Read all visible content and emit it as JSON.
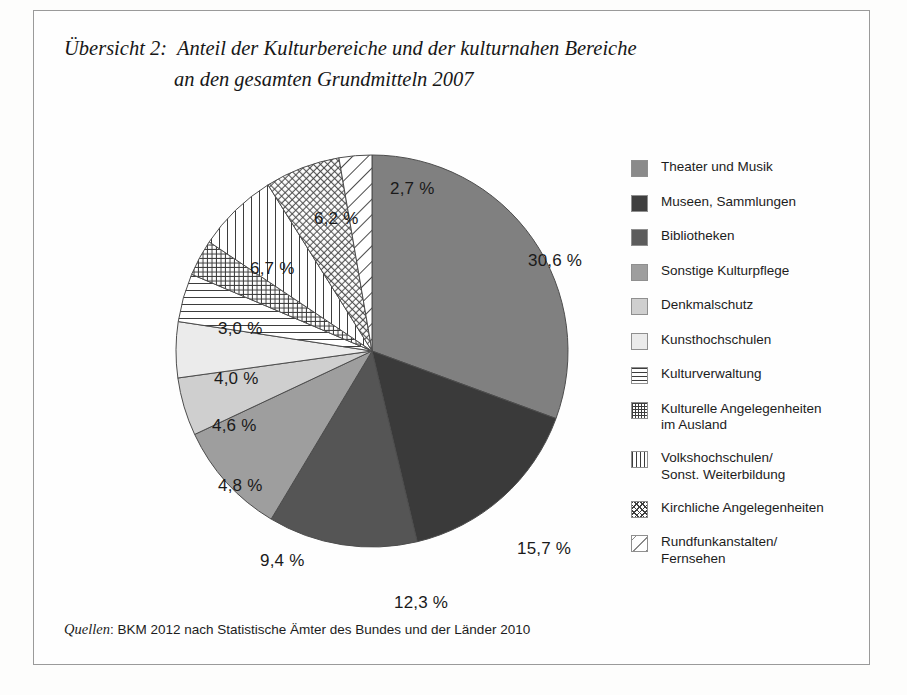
{
  "figure": {
    "title_line1": "Übersicht 2:  Anteil der Kulturbereiche und der kulturnahen Bereiche",
    "title_line2": "an den gesamten Grundmitteln 2007",
    "source_key": "Quellen",
    "source_text": ": BKM 2012 nach Statistische Ämter des Bundes und der Länder 2010",
    "border_color": "#9a9a9a",
    "background": "#fefefe"
  },
  "chart_data": {
    "type": "pie",
    "title": "Übersicht 2:  Anteil der Kulturbereiche und der kulturnahen Bereiche an den gesamten Grundmitteln 2007",
    "unit": "%",
    "total": 100.0,
    "start_angle_deg": 0,
    "direction": "clockwise",
    "legend_position": "right",
    "categories": [
      "Theater und Musik",
      "Museen, Sammlungen",
      "Bibliotheken",
      "Sonstige Kulturpflege",
      "Denkmalschutz",
      "Kunsthochschulen",
      "Kulturverwaltung",
      "Kulturelle Angelegenheiten im Ausland",
      "Volkshochschulen/Sonst. Weiterbildung",
      "Kirchliche Angelegenheiten",
      "Rundfunkanstalten/Fernsehen"
    ],
    "values": [
      30.6,
      15.7,
      12.3,
      9.4,
      4.8,
      4.6,
      4.0,
      3.0,
      6.7,
      6.2,
      2.7
    ],
    "value_labels": [
      "30,6 %",
      "15,7 %",
      "12,3 %",
      "9,4 %",
      "4,8 %",
      "4,6 %",
      "4,0 %",
      "3,0 %",
      "6,7 %",
      "6,2 %",
      "2,7 %"
    ]
  },
  "slices": [
    {
      "label": "Theater und Musik",
      "value_label": "30,6 %",
      "value": 30.6,
      "fill": "#808080",
      "pattern": "solid",
      "label_x": 356,
      "label_y": 100
    },
    {
      "label": "Museen, Sammlungen",
      "value_label": "15,7 %",
      "value": 15.7,
      "fill": "#3a3a3a",
      "pattern": "solid",
      "label_x": 345,
      "label_y": 388
    },
    {
      "label": "Bibliotheken",
      "value_label": "12,3 %",
      "value": 12.3,
      "fill": "#555555",
      "pattern": "solid",
      "label_x": 222,
      "label_y": 442
    },
    {
      "label": "Sonstige Kulturpflege",
      "value_label": "9,4 %",
      "value": 9.4,
      "fill": "#9e9e9e",
      "pattern": "solid",
      "label_x": 88,
      "label_y": 400
    },
    {
      "label": "Denkmalschutz",
      "value_label": "4,8 %",
      "value": 4.8,
      "fill": "#cfcfcf",
      "pattern": "solid",
      "label_x": 46,
      "label_y": 325
    },
    {
      "label": "Kunsthochschulen",
      "value_label": "4,6 %",
      "value": 4.6,
      "fill": "#ebebeb",
      "pattern": "solid",
      "label_x": 40,
      "label_y": 265
    },
    {
      "label": "Kulturverwaltung",
      "value_label": "4,0 %",
      "value": 4.0,
      "fill": "#ffffff",
      "pattern": "horizontal-lines",
      "label_x": 42,
      "label_y": 218
    },
    {
      "label": "Kulturelle Angelegenheiten im Ausland",
      "value_label": "3,0 %",
      "value": 3.0,
      "fill": "#ffffff",
      "pattern": "grid",
      "label_x": 46,
      "label_y": 168
    },
    {
      "label": "Volkshochschulen/Sonst. Weiterbildung",
      "value_label": "6,7 %",
      "value": 6.7,
      "fill": "#ffffff",
      "pattern": "vertical-lines",
      "label_x": 78,
      "label_y": 108
    },
    {
      "label": "Kirchliche Angelegenheiten",
      "value_label": "6,2 %",
      "value": 6.2,
      "fill": "#ffffff",
      "pattern": "diagonal-crosshatch",
      "label_x": 142,
      "label_y": 58
    },
    {
      "label": "Rundfunkanstalten/Fernsehen",
      "value_label": "2,7 %",
      "value": 2.7,
      "fill": "#ffffff",
      "pattern": "diagonal-lines",
      "label_x": 218,
      "label_y": 28
    }
  ],
  "legend": {
    "items": [
      {
        "label": "Theater und Musik",
        "pattern": "solid",
        "fill": "#8a8a8a"
      },
      {
        "label": "Museen, Sammlungen",
        "pattern": "solid",
        "fill": "#3f3f3f"
      },
      {
        "label": "Bibliotheken",
        "pattern": "solid",
        "fill": "#5c5c5c"
      },
      {
        "label": "Sonstige Kulturpflege",
        "pattern": "solid",
        "fill": "#9e9e9e"
      },
      {
        "label": "Denkmalschutz",
        "pattern": "solid",
        "fill": "#cfcfcf"
      },
      {
        "label": "Kunsthochschulen",
        "pattern": "solid",
        "fill": "#ebebeb"
      },
      {
        "label": "Kulturverwaltung",
        "pattern": "horizontal-lines",
        "fill": "#ffffff"
      },
      {
        "label": "Kulturelle Angelegenheiten\nim Ausland",
        "pattern": "grid",
        "fill": "#ffffff"
      },
      {
        "label": "Volkshochschulen/\nSonst. Weiterbildung",
        "pattern": "vertical-lines",
        "fill": "#ffffff"
      },
      {
        "label": "Kirchliche Angelegenheiten",
        "pattern": "diagonal-crosshatch",
        "fill": "#ffffff"
      },
      {
        "label": "Rundfunkanstalten/\nFernsehen",
        "pattern": "diagonal-lines",
        "fill": "#ffffff"
      }
    ]
  }
}
